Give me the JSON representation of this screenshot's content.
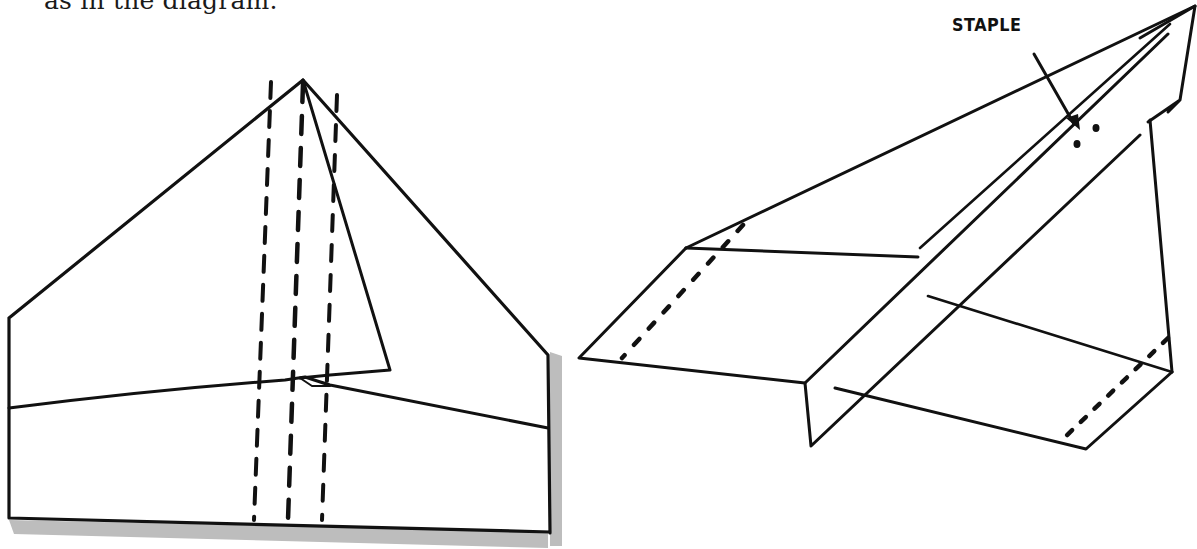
{
  "caption": "as in the diagram.",
  "figures": {
    "left": {
      "description": "paper airplane folded flat, fold lines dashed"
    },
    "right": {
      "description": "assembled paper airplane with wing flaps folded up",
      "label": "STAPLE"
    }
  },
  "colors": {
    "ink": "#111111",
    "shadow": "#b8b8b8",
    "background": "#ffffff"
  }
}
